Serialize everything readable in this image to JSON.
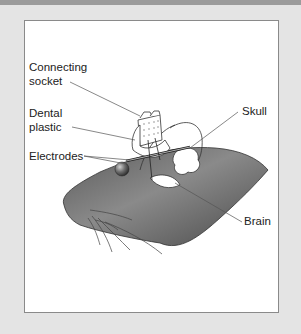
{
  "figure": {
    "labels": {
      "connecting_socket_1": "Connecting",
      "connecting_socket_2": "socket",
      "dental_plastic_1": "Dental",
      "dental_plastic_2": "plastic",
      "electrodes": "Electrodes",
      "skull": "Skull",
      "brain": "Brain"
    },
    "colors": {
      "head_fill": "#6f6f6f",
      "panel_bg": "#ffffff",
      "frame_bg": "#e4e4e4",
      "top_band": "#9b9b9b"
    }
  }
}
